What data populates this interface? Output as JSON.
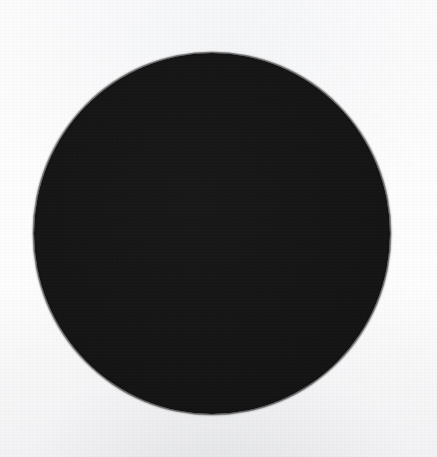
{
  "image": {
    "kind": "scanned-figure",
    "width": 437,
    "height": 457,
    "background_color": "#fdfdfd",
    "background_color_bottom": "#f2f2f4",
    "text_content": "",
    "caption": "",
    "label": ""
  },
  "shapes": [
    {
      "name": "filled-circle",
      "type": "circle",
      "fill_color": "#151515",
      "stroke_color": "#121212",
      "center_x": 212,
      "center_y": 234,
      "width": 356,
      "height": 361,
      "left": 34,
      "top": 53,
      "edge_quality": "soft"
    }
  ]
}
